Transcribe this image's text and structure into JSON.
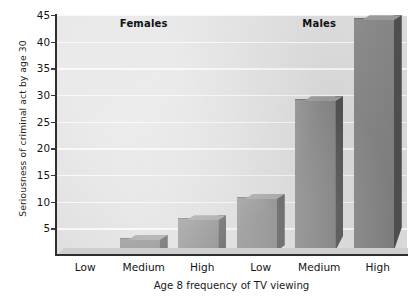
{
  "chart_data": {
    "type": "bar",
    "title": "",
    "xlabel": "Age 8 frequency of TV viewing",
    "ylabel": "Seriousness of criminal act by age 30",
    "categories": [
      "Low",
      "Medium",
      "High",
      "Low",
      "Medium",
      "High"
    ],
    "groups": [
      {
        "label": "Females",
        "categories": [
          "Low",
          "Medium",
          "High"
        ],
        "values": [
          0.3,
          3.0,
          6.7
        ]
      },
      {
        "label": "Males",
        "categories": [
          "Low",
          "Medium",
          "High"
        ],
        "values": [
          10.7,
          29.0,
          44.2
        ]
      }
    ],
    "values": [
      0.3,
      3.0,
      6.7,
      10.7,
      29.0,
      44.2
    ],
    "ylim": [
      0,
      45
    ],
    "ytick_labels": [
      "5",
      "10",
      "15",
      "20",
      "25",
      "30",
      "35",
      "40",
      "45"
    ],
    "ytick_values": [
      5,
      10,
      15,
      20,
      25,
      30,
      35,
      40,
      45
    ],
    "grid": true,
    "legend": "none",
    "colors": {
      "bar_face": "#868686",
      "bar_side": "#4f4f4f",
      "plot_background": "#dcdcdc",
      "gridline": "#f6f6f6",
      "axis": "#2f2f2f",
      "text": "#141414"
    }
  },
  "annotations": {
    "females_header": "Females",
    "males_header": "Males"
  }
}
